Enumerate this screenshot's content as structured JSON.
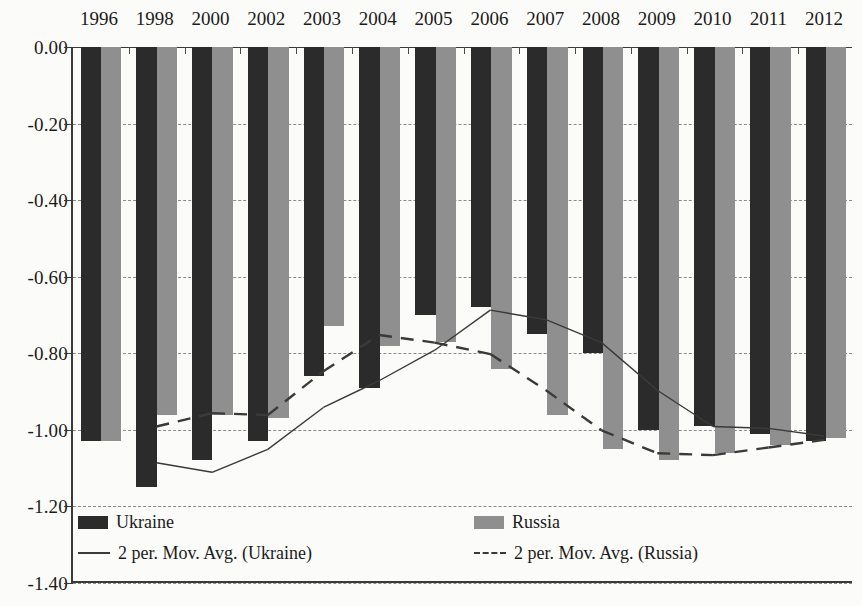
{
  "chart_data": {
    "type": "bar",
    "title": "",
    "subtitle": "",
    "xlabel": "",
    "ylabel": "",
    "categories": [
      "1996",
      "1998",
      "2000",
      "2002",
      "2003",
      "2004",
      "2005",
      "2006",
      "2007",
      "2008",
      "2009",
      "2010",
      "2011",
      "2012"
    ],
    "series": [
      {
        "name": "Ukraine",
        "color": "#2b2b2b",
        "values": [
          -1.03,
          -1.15,
          -1.08,
          -1.03,
          -0.86,
          -0.89,
          -0.7,
          -0.68,
          -0.75,
          -0.8,
          -1.0,
          -0.99,
          -1.01,
          -1.03
        ]
      },
      {
        "name": "Russia",
        "color": "#8f8f8f",
        "values": [
          -1.03,
          -0.96,
          -0.96,
          -0.97,
          -0.73,
          -0.78,
          -0.77,
          -0.84,
          -0.96,
          -1.05,
          -1.08,
          -1.06,
          -1.04,
          -1.02
        ]
      }
    ],
    "trendlines": [
      {
        "name": "2 per. Mov. Avg. (Ukraine)",
        "style": "solid",
        "color": "#3a3a3a",
        "values": [
          null,
          -1.09,
          -1.115,
          -1.055,
          -0.945,
          -0.875,
          -0.795,
          -0.69,
          -0.715,
          -0.775,
          -0.9,
          -0.995,
          -1.0,
          -1.02
        ]
      },
      {
        "name": "2 per. Mov. Avg. (Russia)",
        "style": "dashed",
        "color": "#3a3a3a",
        "values": [
          null,
          -0.995,
          -0.96,
          -0.965,
          -0.85,
          -0.755,
          -0.775,
          -0.805,
          -0.9,
          -1.005,
          -1.065,
          -1.07,
          -1.05,
          -1.03
        ]
      }
    ],
    "ylim": [
      -1.4,
      0.0
    ],
    "yticks": [
      0.0,
      -0.2,
      -0.4,
      -0.6,
      -0.8,
      -1.0,
      -1.2,
      -1.4
    ],
    "ytick_labels": [
      "0.00",
      "-0.20",
      "-0.40",
      "-0.60",
      "-0.80",
      "-1.00",
      "-1.20",
      "-1.40"
    ],
    "grid": true,
    "grid_style": "dashed-horizontal",
    "legend_position": "bottom-inside",
    "x_axis_position": "top"
  },
  "legend": {
    "entries": [
      {
        "label": "Ukraine",
        "marker": "filled-box-dark",
        "color": "#2b2b2b"
      },
      {
        "label": "Russia",
        "marker": "filled-box-gray",
        "color": "#8f8f8f"
      },
      {
        "label": "2 per. Mov. Avg. (Ukraine)",
        "marker": "solid-line",
        "color": "#3a3a3a"
      },
      {
        "label": "2 per. Mov. Avg. (Russia)",
        "marker": "dashed-line",
        "color": "#3a3a3a"
      }
    ]
  }
}
